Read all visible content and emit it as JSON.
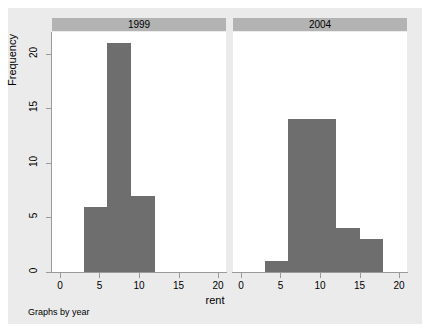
{
  "figure": {
    "y_axis_title": "Frequency",
    "x_axis_title": "rent",
    "note": "Graphs by year",
    "bar_color": "#6e6e6e",
    "panel_title_bg": "#b3b3b3",
    "graph_bg": "#ebebeb",
    "plot_bg": "#ffffff",
    "axis_color": "#9a9a9a"
  },
  "chart_data": {
    "type": "bar",
    "subtype": "histogram-panel",
    "title": "",
    "xlabel": "rent",
    "ylabel": "Frequency",
    "note": "Graphs by year",
    "xlim": [
      -1,
      21
    ],
    "ylim": [
      0,
      22
    ],
    "xticks": [
      0,
      5,
      10,
      15,
      20
    ],
    "yticks": [
      0,
      5,
      10,
      15,
      20
    ],
    "xtick_labels": [
      "0",
      "5",
      "10",
      "15",
      "20"
    ],
    "ytick_labels": [
      "0",
      "5",
      "10",
      "15",
      "20"
    ],
    "grid": false,
    "legend": "none",
    "panel_variable": "year",
    "panels": [
      {
        "label": "1999",
        "bin_width": 3,
        "bins": [
          {
            "x0": 3,
            "x1": 6,
            "frequency": 6
          },
          {
            "x0": 6,
            "x1": 9,
            "frequency": 21
          },
          {
            "x0": 9,
            "x1": 12,
            "frequency": 7
          }
        ]
      },
      {
        "label": "2004",
        "bin_width": 3,
        "bins": [
          {
            "x0": 3,
            "x1": 6,
            "frequency": 1
          },
          {
            "x0": 6,
            "x1": 9,
            "frequency": 14
          },
          {
            "x0": 9,
            "x1": 12,
            "frequency": 14
          },
          {
            "x0": 12,
            "x1": 15,
            "frequency": 4
          },
          {
            "x0": 15,
            "x1": 18,
            "frequency": 3
          }
        ]
      }
    ]
  }
}
